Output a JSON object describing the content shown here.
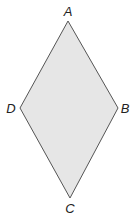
{
  "diagram": {
    "type": "rhombus",
    "fill": "#e6e6e6",
    "stroke": "#555555",
    "vertices": [
      {
        "name": "A",
        "x": 68,
        "y": 21,
        "label_x": 68,
        "label_y": 11
      },
      {
        "name": "B",
        "x": 118,
        "y": 108,
        "label_x": 125,
        "label_y": 108
      },
      {
        "name": "C",
        "x": 70,
        "y": 198,
        "label_x": 70,
        "label_y": 208
      },
      {
        "name": "D",
        "x": 20,
        "y": 108,
        "label_x": 11,
        "label_y": 108
      }
    ],
    "labels": {
      "a": "A",
      "b": "B",
      "c": "C",
      "d": "D"
    }
  }
}
